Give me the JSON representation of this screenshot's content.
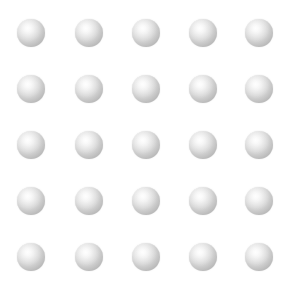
{
  "scene": {
    "title": "Sphere Grid",
    "background_color": "#ffffff",
    "width": 292,
    "height": 286
  },
  "grid": {
    "rows": 5,
    "columns": 5,
    "count": 25,
    "column_centers_x": [
      31,
      89,
      146,
      203,
      259
    ],
    "row_centers_y": [
      33,
      89,
      145,
      201,
      257
    ],
    "column_spacing": 57,
    "row_spacing": 56
  },
  "sphere": {
    "name": "gray-sphere",
    "diameter": 28,
    "shape": "circle",
    "shading": "radial-gradient",
    "highlight_position": "upper-left",
    "highlight_color": "#fdfdfd",
    "mid_color": "#d8d8d8",
    "edge_color": "#ababab"
  },
  "spheres": [
    {
      "row": 1,
      "col": 1,
      "cx": 31,
      "cy": 33
    },
    {
      "row": 1,
      "col": 2,
      "cx": 89,
      "cy": 33
    },
    {
      "row": 1,
      "col": 3,
      "cx": 146,
      "cy": 33
    },
    {
      "row": 1,
      "col": 4,
      "cx": 203,
      "cy": 33
    },
    {
      "row": 1,
      "col": 5,
      "cx": 259,
      "cy": 33
    },
    {
      "row": 2,
      "col": 1,
      "cx": 31,
      "cy": 89
    },
    {
      "row": 2,
      "col": 2,
      "cx": 89,
      "cy": 89
    },
    {
      "row": 2,
      "col": 3,
      "cx": 146,
      "cy": 89
    },
    {
      "row": 2,
      "col": 4,
      "cx": 203,
      "cy": 89
    },
    {
      "row": 2,
      "col": 5,
      "cx": 259,
      "cy": 89
    },
    {
      "row": 3,
      "col": 1,
      "cx": 31,
      "cy": 145
    },
    {
      "row": 3,
      "col": 2,
      "cx": 89,
      "cy": 145
    },
    {
      "row": 3,
      "col": 3,
      "cx": 146,
      "cy": 145
    },
    {
      "row": 3,
      "col": 4,
      "cx": 203,
      "cy": 145
    },
    {
      "row": 3,
      "col": 5,
      "cx": 259,
      "cy": 145
    },
    {
      "row": 4,
      "col": 1,
      "cx": 31,
      "cy": 201
    },
    {
      "row": 4,
      "col": 2,
      "cx": 89,
      "cy": 201
    },
    {
      "row": 4,
      "col": 3,
      "cx": 146,
      "cy": 201
    },
    {
      "row": 4,
      "col": 4,
      "cx": 203,
      "cy": 201
    },
    {
      "row": 4,
      "col": 5,
      "cx": 259,
      "cy": 201
    },
    {
      "row": 5,
      "col": 1,
      "cx": 31,
      "cy": 257
    },
    {
      "row": 5,
      "col": 2,
      "cx": 89,
      "cy": 257
    },
    {
      "row": 5,
      "col": 3,
      "cx": 146,
      "cy": 257
    },
    {
      "row": 5,
      "col": 4,
      "cx": 203,
      "cy": 257
    },
    {
      "row": 5,
      "col": 5,
      "cx": 259,
      "cy": 257
    }
  ]
}
